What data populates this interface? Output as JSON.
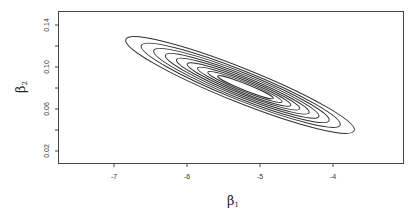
{
  "chart_data": {
    "type": "contour",
    "title": "",
    "xlabel": "β1",
    "ylabel": "β2",
    "xlim": [
      -7.6,
      -3.1
    ],
    "ylim": [
      0.007,
      0.152
    ],
    "x_ticks": [
      -7,
      -6,
      -5,
      -4
    ],
    "x_tick_labels": [
      "-7",
      "-6",
      "-5",
      "-4"
    ],
    "y_ticks": [
      0.02,
      0.04,
      0.06,
      0.08,
      0.1,
      0.12,
      0.14
    ],
    "y_tick_labels": [
      "0.02",
      "",
      "0.06",
      "",
      "0.10",
      "",
      "0.14"
    ],
    "grid": false,
    "legend": null,
    "contours": {
      "count": 9,
      "center": {
        "x": -5.27,
        "y": 0.083
      },
      "outer_extent": {
        "x_min": -7.11,
        "x_max": -3.99,
        "y_at_xmin": 0.123,
        "y_at_xmax": 0.036
      },
      "orientation_deg": -21.8,
      "line_color": "#333333"
    }
  },
  "axes": {
    "x_label_main": "β",
    "x_label_sub": "1",
    "y_label_main": "β",
    "y_label_sub": "2"
  },
  "ticks": {
    "x": [
      "-7",
      "-6",
      "-5",
      "-4"
    ],
    "y": [
      "0.14",
      "0.10",
      "0.06",
      "0.02"
    ]
  }
}
